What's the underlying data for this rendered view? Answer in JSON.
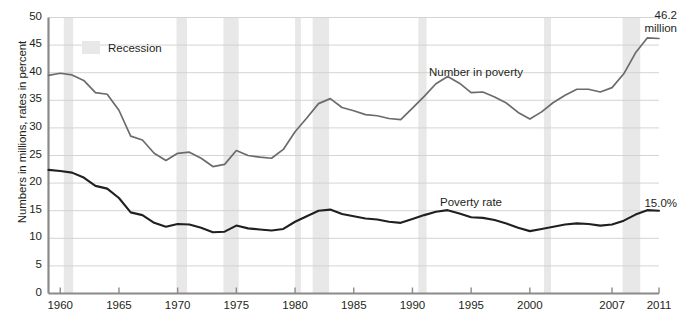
{
  "chart_data": {
    "type": "line",
    "title": "",
    "subtitle": "",
    "xlabel": "",
    "ylabel": "Numbers in millions, rates in percent",
    "xlim": [
      1959,
      2011
    ],
    "ylim": [
      0,
      50
    ],
    "y_ticks": [
      0,
      5,
      10,
      15,
      20,
      25,
      30,
      35,
      40,
      45,
      50
    ],
    "x_ticks": [
      1960,
      1965,
      1970,
      1975,
      1980,
      1985,
      1990,
      1995,
      2000,
      2007,
      2011
    ],
    "grid": true,
    "legend_position": "top-left",
    "legend": [
      {
        "label": "Recession",
        "color": "#e8e8e8",
        "type": "band"
      }
    ],
    "series": [
      {
        "name": "Number in poverty",
        "units": "millions",
        "color": "#6b6b6b",
        "inline_label": "Number in poverty",
        "end_annotation": "46.2\nmillion",
        "x": [
          1959,
          1960,
          1961,
          1962,
          1963,
          1964,
          1965,
          1966,
          1967,
          1968,
          1969,
          1970,
          1971,
          1972,
          1973,
          1974,
          1975,
          1976,
          1977,
          1978,
          1979,
          1980,
          1981,
          1982,
          1983,
          1984,
          1985,
          1986,
          1987,
          1988,
          1989,
          1990,
          1991,
          1992,
          1993,
          1994,
          1995,
          1996,
          1997,
          1998,
          1999,
          2000,
          2001,
          2002,
          2003,
          2004,
          2005,
          2006,
          2007,
          2008,
          2009,
          2010,
          2011
        ],
        "values": [
          39.5,
          39.9,
          39.6,
          38.6,
          36.4,
          36.1,
          33.2,
          28.5,
          27.8,
          25.4,
          24.1,
          25.4,
          25.6,
          24.5,
          23.0,
          23.4,
          25.9,
          25.0,
          24.7,
          24.5,
          26.1,
          29.3,
          31.8,
          34.4,
          35.3,
          33.7,
          33.1,
          32.4,
          32.2,
          31.7,
          31.5,
          33.6,
          35.7,
          38.0,
          39.3,
          38.1,
          36.4,
          36.5,
          35.6,
          34.5,
          32.8,
          31.6,
          32.9,
          34.6,
          35.9,
          37.0,
          37.0,
          36.5,
          37.3,
          39.8,
          43.6,
          46.3,
          46.2
        ]
      },
      {
        "name": "Poverty rate",
        "units": "percent",
        "color": "#231f20",
        "inline_label": "Poverty rate",
        "end_annotation": "15.0%",
        "x": [
          1959,
          1960,
          1961,
          1962,
          1963,
          1964,
          1965,
          1966,
          1967,
          1968,
          1969,
          1970,
          1971,
          1972,
          1973,
          1974,
          1975,
          1976,
          1977,
          1978,
          1979,
          1980,
          1981,
          1982,
          1983,
          1984,
          1985,
          1986,
          1987,
          1988,
          1989,
          1990,
          1991,
          1992,
          1993,
          1994,
          1995,
          1996,
          1997,
          1998,
          1999,
          2000,
          2001,
          2002,
          2003,
          2004,
          2005,
          2006,
          2007,
          2008,
          2009,
          2010,
          2011
        ],
        "values": [
          22.4,
          22.2,
          21.9,
          21.0,
          19.5,
          19.0,
          17.3,
          14.7,
          14.2,
          12.8,
          12.1,
          12.6,
          12.5,
          11.9,
          11.1,
          11.2,
          12.3,
          11.8,
          11.6,
          11.4,
          11.7,
          13.0,
          14.0,
          15.0,
          15.2,
          14.4,
          14.0,
          13.6,
          13.4,
          13.0,
          12.8,
          13.5,
          14.2,
          14.8,
          15.1,
          14.5,
          13.8,
          13.7,
          13.3,
          12.7,
          11.9,
          11.3,
          11.7,
          12.1,
          12.5,
          12.7,
          12.6,
          12.3,
          12.5,
          13.2,
          14.3,
          15.1,
          15.0
        ]
      }
    ],
    "recession_bands": [
      {
        "start": 1960.3,
        "end": 1961.1
      },
      {
        "start": 1969.9,
        "end": 1970.8
      },
      {
        "start": 1973.9,
        "end": 1975.2
      },
      {
        "start": 1980.0,
        "end": 1980.5
      },
      {
        "start": 1981.5,
        "end": 1982.9
      },
      {
        "start": 1990.5,
        "end": 1991.2
      },
      {
        "start": 2001.2,
        "end": 2001.8
      },
      {
        "start": 2007.9,
        "end": 2009.4
      }
    ],
    "band_color": "#e8e8e8"
  },
  "axis": {
    "y_label": "Numbers in millions, rates in percent",
    "y_tick_labels": [
      "50",
      "45",
      "40",
      "35",
      "30",
      "25",
      "20",
      "15",
      "10",
      "5",
      "0"
    ],
    "x_tick_labels": [
      "1960",
      "1965",
      "1970",
      "1975",
      "1980",
      "1985",
      "1990",
      "1995",
      "2000",
      "2007",
      "2011"
    ]
  },
  "legend": {
    "recession_label": "Recession",
    "recession_color": "#e8e8e8"
  },
  "labels": {
    "number_in_poverty": "Number in poverty",
    "poverty_rate": "Poverty rate"
  },
  "annotations": {
    "count_value": "46.2",
    "count_unit": "million",
    "rate_value": "15.0%"
  },
  "colors": {
    "count_line": "#6b6b6b",
    "rate_line": "#231f20",
    "grid": "#cfcfcf",
    "axis": "#8a8a8a",
    "band": "#e8e8e8"
  }
}
